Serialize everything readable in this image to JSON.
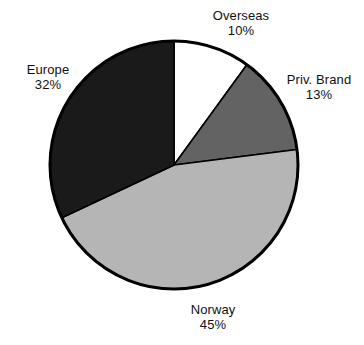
{
  "chart_data": {
    "type": "pie",
    "title": "",
    "subtitle": "",
    "xlabel": "",
    "ylabel": "",
    "legend_position": "none",
    "grid": false,
    "start_angle_deg": 0,
    "direction": "clockwise",
    "categories": [
      "Overseas",
      "Priv. Brand",
      "Norway",
      "Europe"
    ],
    "values": [
      10,
      13,
      45,
      32
    ],
    "value_unit": "%",
    "slices": [
      {
        "label": "Overseas",
        "value": 10,
        "value_text": "10%",
        "color": "#ffffff",
        "start_deg": 0,
        "end_deg": 36
      },
      {
        "label": "Priv. Brand",
        "value": 13,
        "value_text": "13%",
        "color": "#636363",
        "start_deg": 36,
        "end_deg": 82.8
      },
      {
        "label": "Norway",
        "value": 45,
        "value_text": "45%",
        "color": "#b5b5b5",
        "start_deg": 82.8,
        "end_deg": 244.8
      },
      {
        "label": "Europe",
        "value": 32,
        "value_text": "32%",
        "color": "#1a1a1a",
        "start_deg": 244.8,
        "end_deg": 360
      }
    ],
    "outline_color": "#000000",
    "background_color": "#ffffff"
  },
  "labels": {
    "overseas": {
      "name": "Overseas",
      "value": "10%"
    },
    "priv_brand": {
      "name": "Priv. Brand",
      "value": "13%"
    },
    "norway": {
      "name": "Norway",
      "value": "45%"
    },
    "europe": {
      "name": "Europe",
      "value": "32%"
    }
  },
  "colors": {
    "overseas": "#ffffff",
    "priv_brand": "#636363",
    "norway": "#b5b5b5",
    "europe": "#1a1a1a",
    "outline": "#000000",
    "text": "#111111",
    "background": "#ffffff"
  }
}
